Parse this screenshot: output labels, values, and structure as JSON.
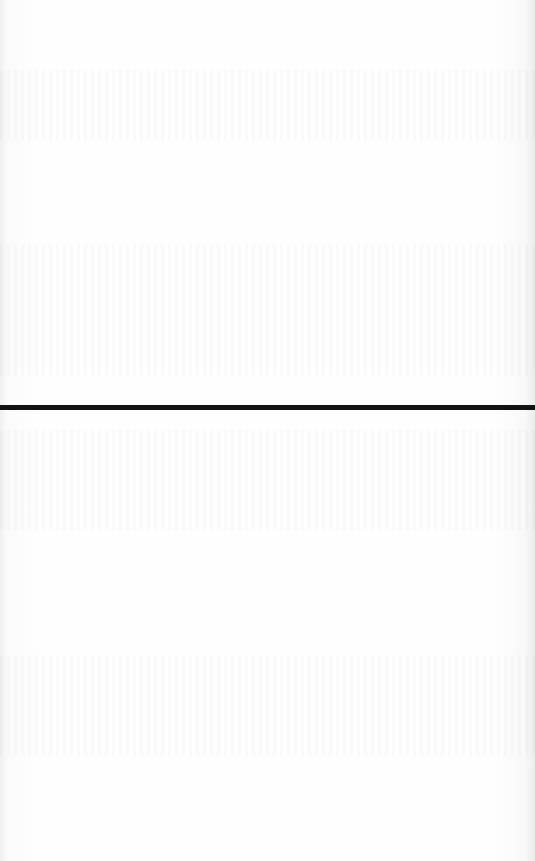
{
  "document": {
    "type": "scanned-page",
    "background_color": "#fdfdfd",
    "rule": {
      "color": "#121212",
      "y": 405,
      "thickness": 5
    },
    "bleed_through_regions": [
      {
        "top": 70,
        "height": 70
      },
      {
        "top": 245,
        "height": 130
      },
      {
        "top": 430,
        "height": 100
      },
      {
        "top": 655,
        "height": 100
      }
    ],
    "visible_text": ""
  }
}
